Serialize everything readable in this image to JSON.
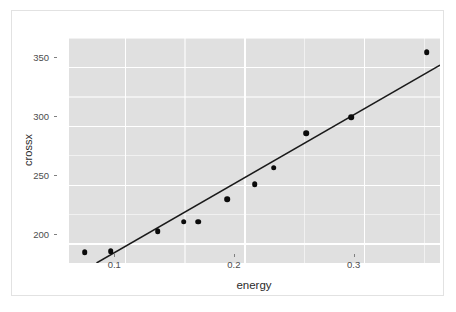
{
  "chart_data": {
    "type": "scatter",
    "title": "",
    "xlabel": "energy",
    "ylabel": "crossx",
    "xlim": [
      0.053,
      0.363
    ],
    "ylim": [
      184,
      375
    ],
    "xticks": [
      0.1,
      0.2,
      0.3
    ],
    "xtick_labels": [
      "0.1",
      "0.2",
      "0.3"
    ],
    "yticks": [
      200,
      250,
      300,
      350
    ],
    "ytick_labels": [
      "200",
      "250",
      "300",
      "350"
    ],
    "grid": true,
    "grid_color": "#ffffff",
    "panel_color": "#e0e0e0",
    "legend": "none",
    "point_color": "#0b0b0b",
    "line_color": "#1a1a1a",
    "x": [
      0.066,
      0.088,
      0.127,
      0.149,
      0.17,
      0.188,
      0.208,
      0.222,
      0.248,
      0.288,
      0.352
    ],
    "y": [
      193,
      194,
      211,
      219,
      238,
      251,
      265,
      294,
      308,
      363,
      0
    ],
    "points": [
      {
        "x": 0.066,
        "y": 193
      },
      {
        "x": 0.088,
        "y": 194
      },
      {
        "x": 0.127,
        "y": 211
      },
      {
        "x": 0.149,
        "y": 219
      },
      {
        "x": 0.17,
        "y": 238
      },
      {
        "x": 0.188,
        "y": 251
      },
      {
        "x": 0.208,
        "y": 265
      },
      {
        "x": 0.222,
        "y": 294
      },
      {
        "x": 0.248,
        "y": 308
      },
      {
        "x": 0.288,
        "y": 363
      }
    ],
    "series": [
      {
        "name": "crossx",
        "kind": "scatter",
        "points": [
          {
            "x": 0.066,
            "y": 193
          },
          {
            "x": 0.088,
            "y": 194
          },
          {
            "x": 0.127,
            "y": 211
          },
          {
            "x": 0.149,
            "y": 219
          },
          {
            "x": 0.161,
            "y": 219
          },
          {
            "x": 0.185,
            "y": 238
          },
          {
            "x": 0.208,
            "y": 251
          },
          {
            "x": 0.224,
            "y": 265
          },
          {
            "x": 0.251,
            "y": 294
          },
          {
            "x": 0.289,
            "y": 308
          },
          {
            "x": 0.352,
            "y": 363
          }
        ]
      },
      {
        "name": "linear-fit",
        "kind": "line",
        "points": [
          {
            "x": 0.076,
            "y": 184
          },
          {
            "x": 0.363,
            "y": 352
          }
        ]
      }
    ],
    "annotations": []
  },
  "axes": {
    "y_label": "crossx",
    "x_label": "energy"
  }
}
